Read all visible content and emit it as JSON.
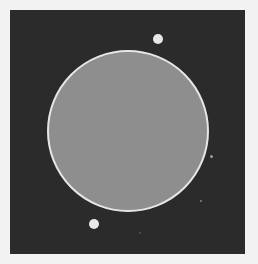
{
  "image": {
    "background": "#f2f2f2",
    "frame": {
      "x": 10,
      "y": 10,
      "w": 235,
      "h": 244,
      "color": "#2b2b2b"
    },
    "planet": {
      "cx": 128,
      "cy": 131,
      "r": 81,
      "fill": "#8e8e8e",
      "rim": "#e6e6e6"
    },
    "moons": [
      {
        "cx": 158,
        "cy": 39,
        "r": 5,
        "color": "#e8e8e8"
      },
      {
        "cx": 94,
        "cy": 224,
        "r": 5,
        "color": "#e8e8e8"
      }
    ],
    "specks": [
      {
        "cx": 211,
        "cy": 156,
        "r": 1.5,
        "color": "#9a9a9a"
      },
      {
        "cx": 201,
        "cy": 201,
        "r": 1.2,
        "color": "#8a8a8a"
      },
      {
        "cx": 140,
        "cy": 233,
        "r": 1,
        "color": "#555555"
      }
    ]
  }
}
